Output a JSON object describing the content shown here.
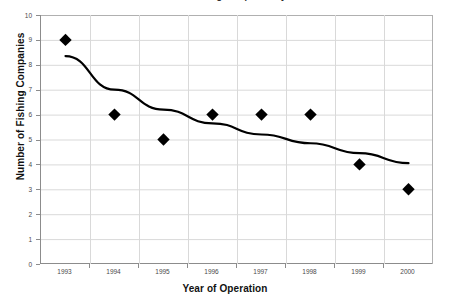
{
  "chart_data": {
    "type": "scatter",
    "title": "Number of Fishing Companies by Year",
    "xlabel": "Year of Operation",
    "ylabel": "Number of Fishing Companies",
    "categories": [
      "1993",
      "1994",
      "1995",
      "1996",
      "1997",
      "1998",
      "1999",
      "2000"
    ],
    "x": [
      1993,
      1994,
      1995,
      1996,
      1997,
      1998,
      1999,
      2000
    ],
    "values": [
      9,
      6,
      5,
      6,
      6,
      6,
      4,
      3
    ],
    "series": [
      {
        "name": "Number of Fishing Companies",
        "marker": "diamond",
        "color": "#000000",
        "values": [
          9,
          6,
          5,
          6,
          6,
          6,
          4,
          3
        ]
      },
      {
        "name": "Trend line",
        "type": "line",
        "color": "#000000",
        "values": [
          8.35,
          7.0,
          6.2,
          5.65,
          5.2,
          4.85,
          4.45,
          4.05
        ]
      }
    ],
    "xlim": [
      1992.5,
      2000.5
    ],
    "ylim": [
      0,
      10
    ],
    "y_ticks": [
      0,
      1,
      2,
      3,
      4,
      5,
      6,
      7,
      8,
      9,
      10
    ],
    "x_ticks": [
      "1993",
      "1994",
      "1995",
      "1996",
      "1997",
      "1998",
      "1999",
      "2000"
    ],
    "grid": true,
    "grid_color": "#d9d9d9",
    "axis_color": "#8c8c8c",
    "legend": false,
    "background": "#ffffff"
  }
}
